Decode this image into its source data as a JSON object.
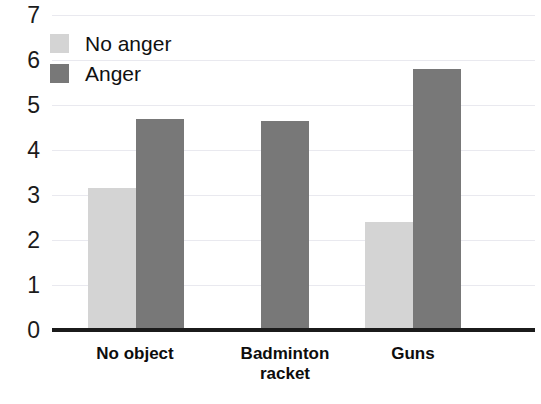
{
  "chart_data": {
    "type": "bar",
    "title": "",
    "subtitle": "",
    "xlabel": "",
    "ylabel": "",
    "ylim": [
      0,
      7
    ],
    "ytick_labels": [
      "0",
      "1",
      "2",
      "3",
      "4",
      "5",
      "6",
      "7"
    ],
    "grid": true,
    "legend_position": "top-left-inside",
    "categories": [
      "No object",
      "Badminton racket",
      "Guns"
    ],
    "category_label_lines": [
      [
        "No object"
      ],
      [
        "Badminton",
        "racket"
      ],
      [
        "Guns"
      ]
    ],
    "series": [
      {
        "name": "No anger",
        "color": "#d4d4d4",
        "values": [
          3.15,
          0,
          2.4
        ]
      },
      {
        "name": "Anger",
        "color": "#787878",
        "values": [
          4.7,
          4.65,
          5.8
        ]
      }
    ]
  },
  "legend": {
    "items": [
      {
        "label": "No anger",
        "swatch": "light"
      },
      {
        "label": "Anger",
        "swatch": "dark"
      }
    ]
  },
  "colors": {
    "light_gray": "#d4d4d4",
    "dark_gray": "#787878",
    "axis": "#1b1b1b",
    "gridline": "#e9e9ef",
    "text": "#101010"
  }
}
